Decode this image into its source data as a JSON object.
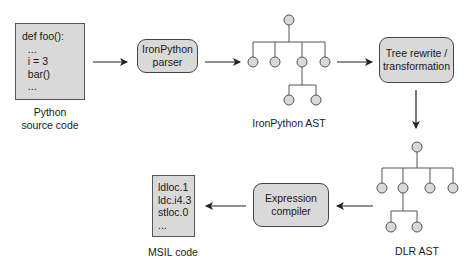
{
  "python_source": {
    "code_lines": [
      "def foo():",
      "  ...",
      "  i = 3",
      "  bar()",
      "  ..."
    ],
    "caption_line1": "Python",
    "caption_line2": "source code"
  },
  "ironpython_parser": {
    "line1": "IronPython",
    "line2": "parser"
  },
  "ironpython_ast": {
    "caption": "IronPython AST"
  },
  "tree_rewrite": {
    "line1": "Tree rewrite /",
    "line2": "transformation"
  },
  "dlr_ast": {
    "caption": "DLR AST"
  },
  "expression_compiler": {
    "line1": "Expression",
    "line2": "compiler"
  },
  "msil": {
    "code_lines": [
      "ldloc.1",
      "ldc.i4.3",
      "stloc.0",
      "..."
    ],
    "caption": "MSIL code"
  },
  "colors": {
    "box_fill": "#d9d9d9",
    "node_fill": "#d9d9d9",
    "stroke": "#333333"
  }
}
